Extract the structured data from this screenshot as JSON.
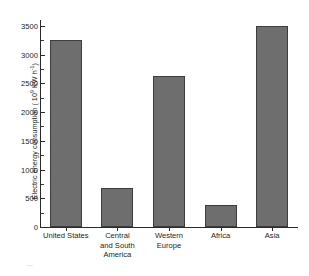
{
  "chart_data": {
    "type": "bar",
    "title": "",
    "xlabel": "",
    "ylabel": "Electric energy consumption ( 10^9 KW h^-1)",
    "ylabel_prefix": "Electric energy consumption ( 10",
    "ylabel_exp1": "9",
    "ylabel_mid": " KW h",
    "ylabel_exp2": "-1",
    "ylabel_suffix": ")",
    "categories": [
      "United States",
      "Central and South America",
      "Western Europe",
      "Africa",
      "Asia"
    ],
    "category_lines": [
      [
        "United States"
      ],
      [
        "Central",
        "and South",
        "America"
      ],
      [
        "Western Europe"
      ],
      [
        "Africa"
      ],
      [
        "Asia"
      ]
    ],
    "values": [
      3250,
      680,
      2620,
      380,
      3500
    ],
    "ylim": [
      0,
      3600
    ],
    "ytick_values": [
      0,
      500,
      1000,
      1500,
      2000,
      2500,
      3000,
      3500
    ],
    "ytick_labels": [
      "0",
      "500",
      "1000",
      "1500",
      "2000",
      "2500",
      "3000",
      "3500"
    ],
    "yminor_values": [
      250,
      750,
      1250,
      1750,
      2250,
      2750,
      3250
    ],
    "grid": false,
    "legend": false,
    "bar_color": "#6e6e6e",
    "bar_edge_color": "#3d3d3d",
    "axis_color": "#2a2a2a"
  },
  "artifact": {
    "mark": "—"
  }
}
